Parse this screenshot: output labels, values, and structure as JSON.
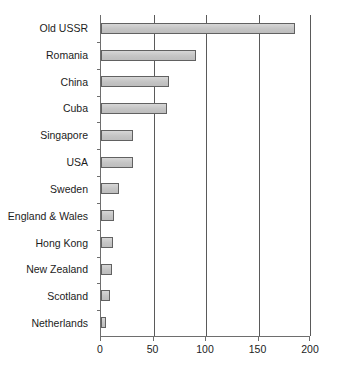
{
  "chart_data": {
    "type": "bar",
    "orientation": "horizontal",
    "title": "",
    "subtitle": "",
    "xlabel": "",
    "ylabel": "",
    "xlim": [
      0,
      200
    ],
    "xticks": [
      0,
      50,
      100,
      150,
      200
    ],
    "xtick_labels": [
      "0",
      "50",
      "100",
      "150",
      "200"
    ],
    "grid": "vertical",
    "legend": "none",
    "bar_fill_color": "#c9c9c9",
    "bar_edge_color": "#616161",
    "axis_color": "#6e6e6e",
    "gridline_color": "#5a5a5a",
    "background_color": "#ffffff",
    "categories": [
      "Old USSR",
      "Romania",
      "China",
      "Cuba",
      "Singapore",
      "USA",
      "Sweden",
      "England & Wales",
      "Hong Kong",
      "New Zealand",
      "Scotland",
      "Netherlands"
    ],
    "values": [
      185,
      90,
      65,
      63,
      30,
      30,
      17,
      12,
      11,
      10,
      9,
      5
    ]
  }
}
